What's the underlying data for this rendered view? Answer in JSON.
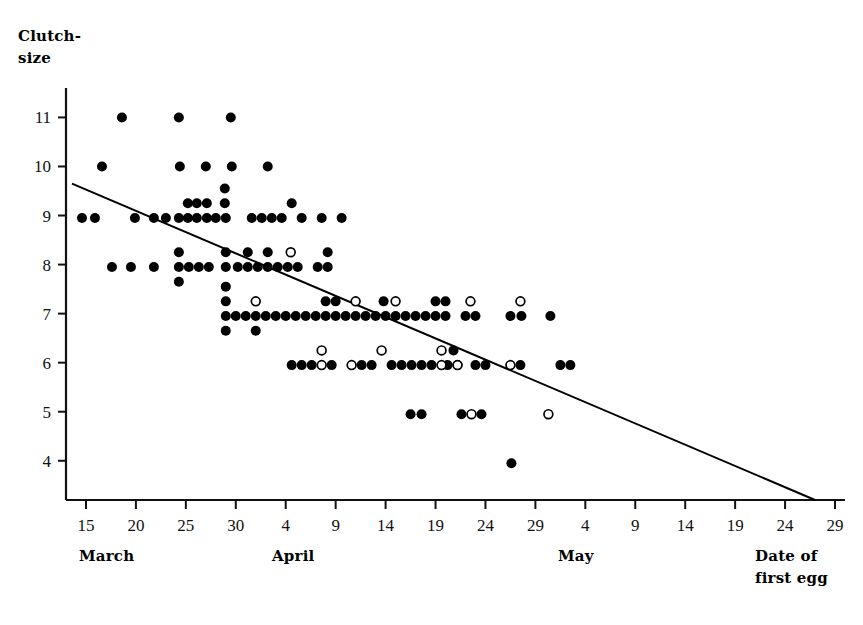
{
  "chart_data": {
    "type": "scatter",
    "title": "",
    "subtitle": "",
    "ylabel": "Clutch-\nsize",
    "ylabel_lines": [
      "Clutch-",
      "size"
    ],
    "xlabel": "Date of\nfirst egg",
    "xlabel_lines": [
      "Date of",
      "first egg"
    ],
    "grid": false,
    "legend": "none",
    "xlim": [
      13,
      91
    ],
    "ylim": [
      3.2,
      11.6
    ],
    "yticks": [
      4,
      5,
      6,
      7,
      8,
      9,
      10,
      11
    ],
    "ytick_labels": [
      "4",
      "5",
      "6",
      "7",
      "8",
      "9",
      "10",
      "11"
    ],
    "xticks": [
      15,
      20,
      25,
      30,
      35,
      40,
      45,
      50,
      55,
      60,
      65,
      70,
      75,
      80,
      85,
      90
    ],
    "xtick_labels": [
      "15",
      "20",
      "25",
      "30",
      "4",
      "9",
      "14",
      "19",
      "24",
      "29",
      "4",
      "9",
      "14",
      "19",
      "24",
      "29"
    ],
    "x_axis_note": "Day-of-March numbering: March 15 = 15, April 1 = 32, May 1 = 62",
    "month_labels": [
      {
        "label": "March",
        "x": 20
      },
      {
        "label": "April",
        "x": 40
      },
      {
        "label": "May",
        "x": 69
      }
    ],
    "series": [
      {
        "name": "filled-circle",
        "marker": "filled circle",
        "color": "#000000",
        "points": [
          [
            18.6,
            11.0
          ],
          [
            24.3,
            11.0
          ],
          [
            29.5,
            11.0
          ],
          [
            16.6,
            10.0
          ],
          [
            24.4,
            10.0
          ],
          [
            27.0,
            10.0
          ],
          [
            29.6,
            10.0
          ],
          [
            33.2,
            10.0
          ],
          [
            14.6,
            8.95
          ],
          [
            15.9,
            8.95
          ],
          [
            19.9,
            8.95
          ],
          [
            21.8,
            8.95
          ],
          [
            23.0,
            8.95
          ],
          [
            24.3,
            8.95
          ],
          [
            25.2,
            8.95
          ],
          [
            26.1,
            8.95
          ],
          [
            27.1,
            8.95
          ],
          [
            28.0,
            8.95
          ],
          [
            29.0,
            8.95
          ],
          [
            31.6,
            8.95
          ],
          [
            32.6,
            8.95
          ],
          [
            33.6,
            8.95
          ],
          [
            34.6,
            8.95
          ],
          [
            36.6,
            8.95
          ],
          [
            38.6,
            8.95
          ],
          [
            40.6,
            8.95
          ],
          [
            25.2,
            9.25
          ],
          [
            26.1,
            9.25
          ],
          [
            27.1,
            9.25
          ],
          [
            28.9,
            9.25
          ],
          [
            35.6,
            9.25
          ],
          [
            28.9,
            9.55
          ],
          [
            17.6,
            7.95
          ],
          [
            19.5,
            7.95
          ],
          [
            21.8,
            7.95
          ],
          [
            24.3,
            7.95
          ],
          [
            25.3,
            7.95
          ],
          [
            26.3,
            7.95
          ],
          [
            27.3,
            7.95
          ],
          [
            29.0,
            7.95
          ],
          [
            30.2,
            7.95
          ],
          [
            31.2,
            7.95
          ],
          [
            32.2,
            7.95
          ],
          [
            33.2,
            7.95
          ],
          [
            34.2,
            7.95
          ],
          [
            35.2,
            7.95
          ],
          [
            36.2,
            7.95
          ],
          [
            38.2,
            7.95
          ],
          [
            39.2,
            7.95
          ],
          [
            24.3,
            8.25
          ],
          [
            29.0,
            8.25
          ],
          [
            31.2,
            8.25
          ],
          [
            33.2,
            8.25
          ],
          [
            39.2,
            8.25
          ],
          [
            24.3,
            7.65
          ],
          [
            29.0,
            6.95
          ],
          [
            30.0,
            6.95
          ],
          [
            31.0,
            6.95
          ],
          [
            32.0,
            6.95
          ],
          [
            33.0,
            6.95
          ],
          [
            34.0,
            6.95
          ],
          [
            35.0,
            6.95
          ],
          [
            36.0,
            6.95
          ],
          [
            37.0,
            6.95
          ],
          [
            38.0,
            6.95
          ],
          [
            39.0,
            6.95
          ],
          [
            40.0,
            6.95
          ],
          [
            41.0,
            6.95
          ],
          [
            42.0,
            6.95
          ],
          [
            43.0,
            6.95
          ],
          [
            44.0,
            6.95
          ],
          [
            45.0,
            6.95
          ],
          [
            46.0,
            6.95
          ],
          [
            47.0,
            6.95
          ],
          [
            48.0,
            6.95
          ],
          [
            49.0,
            6.95
          ],
          [
            50.0,
            6.95
          ],
          [
            51.0,
            6.95
          ],
          [
            53.0,
            6.95
          ],
          [
            54.0,
            6.95
          ],
          [
            57.5,
            6.95
          ],
          [
            58.6,
            6.95
          ],
          [
            61.5,
            6.95
          ],
          [
            29.0,
            7.25
          ],
          [
            39.0,
            7.25
          ],
          [
            40.0,
            7.25
          ],
          [
            44.8,
            7.25
          ],
          [
            50.0,
            7.25
          ],
          [
            51.0,
            7.25
          ],
          [
            29.0,
            7.55
          ],
          [
            32.0,
            6.65
          ],
          [
            29.0,
            6.65
          ],
          [
            35.6,
            5.95
          ],
          [
            36.6,
            5.95
          ],
          [
            37.6,
            5.95
          ],
          [
            39.6,
            5.95
          ],
          [
            42.6,
            5.95
          ],
          [
            43.6,
            5.95
          ],
          [
            45.6,
            5.95
          ],
          [
            46.6,
            5.95
          ],
          [
            47.6,
            5.95
          ],
          [
            48.6,
            5.95
          ],
          [
            49.6,
            5.95
          ],
          [
            51.2,
            5.95
          ],
          [
            52.2,
            5.95
          ],
          [
            54.0,
            5.95
          ],
          [
            55.0,
            5.95
          ],
          [
            58.5,
            5.95
          ],
          [
            62.5,
            5.95
          ],
          [
            63.5,
            5.95
          ],
          [
            51.8,
            6.25
          ],
          [
            47.5,
            4.95
          ],
          [
            48.6,
            4.95
          ],
          [
            52.6,
            4.95
          ],
          [
            54.6,
            4.95
          ],
          [
            57.6,
            3.95
          ]
        ]
      },
      {
        "name": "open-circle",
        "marker": "open circle",
        "color": "#000000",
        "points": [
          [
            35.5,
            8.25
          ],
          [
            32.0,
            7.25
          ],
          [
            42.0,
            7.25
          ],
          [
            46.0,
            7.25
          ],
          [
            53.5,
            7.25
          ],
          [
            58.5,
            7.25
          ],
          [
            38.6,
            6.25
          ],
          [
            44.6,
            6.25
          ],
          [
            50.6,
            6.25
          ],
          [
            38.6,
            5.95
          ],
          [
            41.6,
            5.95
          ],
          [
            50.6,
            5.95
          ],
          [
            52.2,
            5.95
          ],
          [
            57.5,
            5.95
          ],
          [
            53.6,
            4.95
          ],
          [
            61.3,
            4.95
          ]
        ]
      }
    ],
    "regression_line": {
      "x_start": 13.6,
      "y_start": 9.65,
      "x_end": 88.0,
      "y_end": 3.2,
      "color": "#000000",
      "width": 2
    }
  }
}
